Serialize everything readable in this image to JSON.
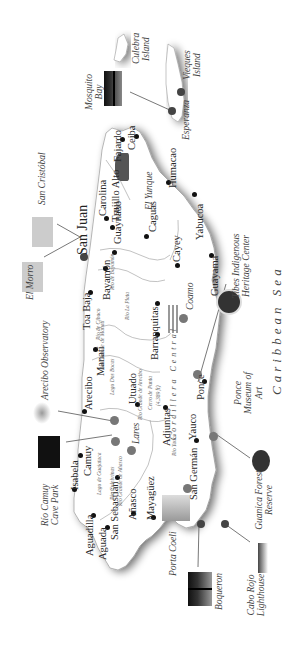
{
  "map": {
    "title": "Puerto Rico",
    "orientation": "rotated 90 degrees counter-clockwise (north at left)",
    "sea_label": "Caribbean Sea",
    "mountain_range": "Cordillera Central",
    "peak": {
      "name": "Cerro de Punta",
      "elevation": "(4,389 ft)"
    },
    "capital": "San Juan",
    "towns": [
      {
        "id": "fajardo",
        "name": "Fajardo"
      },
      {
        "id": "ceiba",
        "name": "Ceiba"
      },
      {
        "id": "carolina",
        "name": "Carolina"
      },
      {
        "id": "trujillo",
        "name": "Trujillo Alto"
      },
      {
        "id": "guaynabo",
        "name": "Guaynabo"
      },
      {
        "id": "caguas",
        "name": "Caguas"
      },
      {
        "id": "humacao",
        "name": "Humacao"
      },
      {
        "id": "yabucoa",
        "name": "Yabucoa"
      },
      {
        "id": "cayey",
        "name": "Cayey"
      },
      {
        "id": "guayama",
        "name": "Guayama"
      },
      {
        "id": "bayamon",
        "name": "Bayamón"
      },
      {
        "id": "toabaja",
        "name": "Toa Baja"
      },
      {
        "id": "barranquitas",
        "name": "Barranquitas"
      },
      {
        "id": "coamo",
        "name": "Coamo"
      },
      {
        "id": "manati",
        "name": "Manatí"
      },
      {
        "id": "utuado",
        "name": "Utuado"
      },
      {
        "id": "arecibo",
        "name": "Arecibo"
      },
      {
        "id": "adjuntas",
        "name": "Adjuntas"
      },
      {
        "id": "ponce",
        "name": "Ponce"
      },
      {
        "id": "lares",
        "name": "Lares"
      },
      {
        "id": "yauco",
        "name": "Yauco"
      },
      {
        "id": "camuy",
        "name": "Camuy"
      },
      {
        "id": "isabela",
        "name": "Isabela"
      },
      {
        "id": "sansebastian",
        "name": "San Sebastián"
      },
      {
        "id": "anasco",
        "name": "Añasco"
      },
      {
        "id": "mayaguez",
        "name": "Mayagüez"
      },
      {
        "id": "sangerman",
        "name": "San Germán"
      },
      {
        "id": "aguadilla",
        "name": "Aguadilla"
      },
      {
        "id": "aguada",
        "name": "Aguada"
      },
      {
        "id": "esperanza",
        "name": "Esperanza"
      }
    ],
    "islands": [
      {
        "name": "Culebra Island"
      },
      {
        "name": "Vieques Island"
      }
    ],
    "rivers": [
      "Río de Bayamón",
      "Río La Plata",
      "Río de Cibuco",
      "Río Grande de Manatí",
      "Lago Dos Bocas",
      "Río Grande de Arecibo",
      "Lago de Guajataca",
      "Río Culebrinas",
      "Río Grande de Añasco",
      "Río Yauco"
    ],
    "attractions": [
      {
        "id": "mosquito",
        "name": "Mosquito Bay"
      },
      {
        "id": "elyunque",
        "name": "El Yunque"
      },
      {
        "id": "sancristobal",
        "name": "San Cristóbal"
      },
      {
        "id": "elmorro",
        "name": "El Morro"
      },
      {
        "id": "arecibo_obs",
        "name": "Arecibo Observatory"
      },
      {
        "id": "riocamuy",
        "name": "Río Camuy Cave Park"
      },
      {
        "id": "tibes",
        "name": "Tibes Indigenous Heritage Center"
      },
      {
        "id": "ponce_museum",
        "name": "Ponce Museum of Art"
      },
      {
        "id": "guanica",
        "name": "Guanica Forest Reserve"
      },
      {
        "id": "porta",
        "name": "Porta Coeli"
      },
      {
        "id": "boqueron",
        "name": "Boqueron"
      },
      {
        "id": "caborojo",
        "name": "Cabo Rojo Lighthouse"
      }
    ],
    "colors": {
      "land": "#ffffff",
      "shadow": "#9a9a9a",
      "dot": "#111111",
      "attraction_dot": "#777777",
      "line": "#555555"
    }
  }
}
